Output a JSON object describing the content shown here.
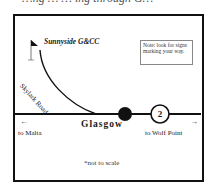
{
  "header": {
    "partial_text": "…ng … … ing through G…"
  },
  "map": {
    "destination": {
      "label": "Sunnyside G&CC",
      "icon": "golf-flag-icon"
    },
    "road": {
      "label": "Skylark Road"
    },
    "town": {
      "label": "Glasgow",
      "marker": "town-dot"
    },
    "highway": {
      "route_number": "2",
      "west": {
        "arrow": "←",
        "label": "to Malta"
      },
      "east": {
        "arrow": "→",
        "label": "to Wolf Point"
      }
    },
    "note": "Note: look for signs marking your way.",
    "scale_note": "*not to scale"
  },
  "colors": {
    "ink": "#111111",
    "frame": "#111111",
    "note_border": "#888888",
    "background": "#ffffff"
  }
}
